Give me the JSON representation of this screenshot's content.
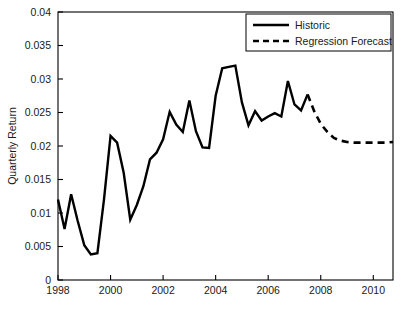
{
  "chart_data": {
    "type": "line",
    "title": "",
    "xlabel": "",
    "ylabel": "Quarterly Return",
    "xlim": [
      1998,
      2010.75
    ],
    "ylim": [
      0,
      0.04
    ],
    "grid": false,
    "legend_position": "top-right",
    "xticks": [
      1998,
      2000,
      2002,
      2004,
      2006,
      2008,
      2010
    ],
    "xtick_labels": [
      "1998",
      "2000",
      "2002",
      "2004",
      "2006",
      "2008",
      "2010"
    ],
    "yticks": [
      0,
      0.005,
      0.01,
      0.015,
      0.02,
      0.025,
      0.03,
      0.035,
      0.04
    ],
    "ytick_labels": [
      "0",
      "0.005",
      "0.01",
      "0.015",
      "0.02",
      "0.025",
      "0.03",
      "0.035",
      "0.04"
    ],
    "series": [
      {
        "name": "Historic",
        "style": "solid",
        "color": "#000000",
        "x": [
          1998.0,
          1998.25,
          1998.5,
          1998.75,
          1999.0,
          1999.25,
          1999.5,
          1999.75,
          2000.0,
          2000.25,
          2000.5,
          2000.75,
          2001.0,
          2001.25,
          2001.5,
          2001.75,
          2002.0,
          2002.25,
          2002.5,
          2002.75,
          2003.0,
          2003.25,
          2003.5,
          2003.75,
          2004.0,
          2004.25,
          2004.5,
          2004.75,
          2005.0,
          2005.25,
          2005.5,
          2005.75,
          2006.0,
          2006.25,
          2006.5,
          2006.75,
          2007.0,
          2007.25,
          2007.5
        ],
        "y": [
          0.012,
          0.0076,
          0.0128,
          0.0088,
          0.0052,
          0.0038,
          0.004,
          0.012,
          0.0215,
          0.0205,
          0.016,
          0.009,
          0.0112,
          0.014,
          0.018,
          0.019,
          0.021,
          0.0251,
          0.0232,
          0.0221,
          0.0268,
          0.0222,
          0.0198,
          0.0197,
          0.0275,
          0.0316,
          0.0318,
          0.032,
          0.0265,
          0.0231,
          0.0252,
          0.0238,
          0.0244,
          0.0249,
          0.0244,
          0.0297,
          0.0262,
          0.0253,
          0.0277
        ],
        "note": "Solid black line, historic quarterly returns 1998 Q1 through 2007 Q3"
      },
      {
        "name": "Regression Forecast",
        "style": "dashed",
        "color": "#000000",
        "x": [
          2007.5,
          2007.75,
          2008.0,
          2008.25,
          2008.5,
          2008.75,
          2009.0,
          2009.25,
          2009.5,
          2009.75,
          2010.0,
          2010.25,
          2010.5,
          2010.75
        ],
        "y": [
          0.0277,
          0.0252,
          0.0233,
          0.0221,
          0.0212,
          0.0208,
          0.0206,
          0.0205,
          0.0205,
          0.0205,
          0.0205,
          0.0205,
          0.0205,
          0.0206
        ],
        "note": "Dashed black line, regression forecast decaying to a flat level near 0.0205"
      }
    ],
    "legend_entries": [
      {
        "label": "Historic",
        "style": "solid"
      },
      {
        "label": "Regression Forecast",
        "style": "dashed"
      }
    ]
  }
}
